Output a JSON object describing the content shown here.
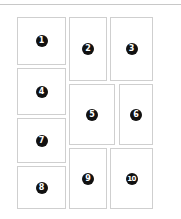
{
  "layout": {
    "boxes": [
      {
        "label": "1",
        "x": 17,
        "y": 17,
        "w": 49,
        "h": 48
      },
      {
        "label": "2",
        "x": 69,
        "y": 17,
        "w": 38,
        "h": 64
      },
      {
        "label": "3",
        "x": 110,
        "y": 17,
        "w": 43,
        "h": 64
      },
      {
        "label": "4",
        "x": 17,
        "y": 68,
        "w": 49,
        "h": 47
      },
      {
        "label": "5",
        "x": 69,
        "y": 84,
        "w": 46,
        "h": 61
      },
      {
        "label": "6",
        "x": 119,
        "y": 84,
        "w": 34,
        "h": 61
      },
      {
        "label": "7",
        "x": 17,
        "y": 118,
        "w": 49,
        "h": 45
      },
      {
        "label": "8",
        "x": 17,
        "y": 166,
        "w": 49,
        "h": 43
      },
      {
        "label": "9",
        "x": 69,
        "y": 148,
        "w": 38,
        "h": 61
      },
      {
        "label": "10",
        "x": 110,
        "y": 148,
        "w": 43,
        "h": 61
      }
    ],
    "colors": {
      "border": "#cfcfcf",
      "badge": "#111111",
      "badge_text": "#ffffff",
      "topline": "#c8c8c8"
    }
  }
}
